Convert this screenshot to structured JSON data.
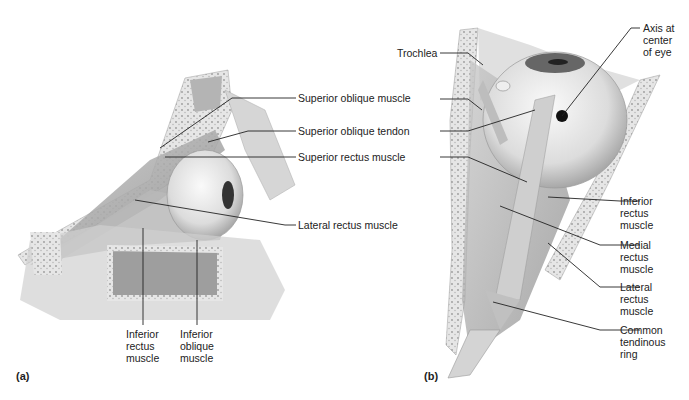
{
  "figure": {
    "panel_a": {
      "tag": "(a)",
      "labels": {
        "superior_oblique_muscle": "Superior oblique muscle",
        "superior_oblique_tendon": "Superior oblique tendon",
        "superior_rectus_muscle": "Superior rectus muscle",
        "lateral_rectus_muscle": "Lateral rectus muscle",
        "inferior_rectus_muscle": "Inferior\nrectus\nmuscle",
        "inferior_oblique_muscle": "Inferior\noblique\nmuscle"
      }
    },
    "panel_b": {
      "tag": "(b)",
      "labels": {
        "trochlea": "Trochlea",
        "axis_center_of_eye": "Axis at\ncenter\nof eye",
        "inferior_rectus_muscle": "Inferior\nrectus\nmuscle",
        "medial_rectus_muscle": "Medial\nrectus\nmuscle",
        "lateral_rectus_muscle": "Lateral\nrectus\nmuscle",
        "common_tendinous_ring": "Common\ntendinous\nring"
      }
    }
  }
}
